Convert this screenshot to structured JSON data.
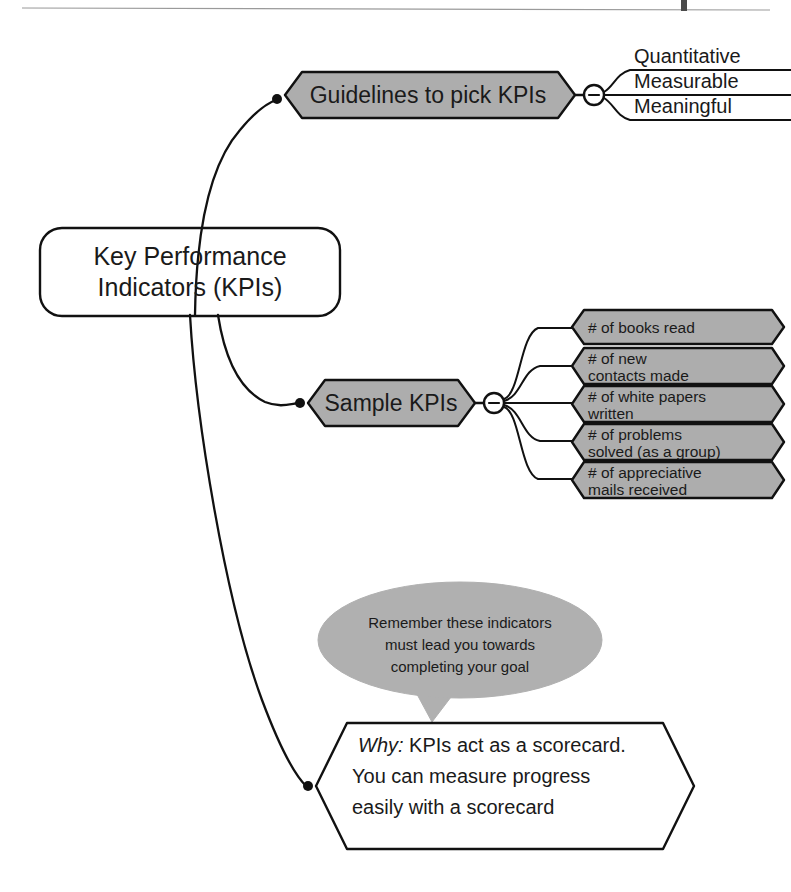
{
  "page": {
    "background_color": "#ffffff",
    "ink_color": "#111111",
    "node_fill_color": "#adadad",
    "bubble_fill_color": "#b0b0b0",
    "rule_color": "#9a9a9a"
  },
  "root": {
    "line1": "Key Performance",
    "line2": "Indicators (KPIs)"
  },
  "branches": [
    {
      "id": "guidelines",
      "label": "Guidelines to pick KPIs",
      "toggle": "collapse-minus-icon",
      "children": [
        {
          "label": "Quantitative"
        },
        {
          "label": "Measurable"
        },
        {
          "label": "Meaningful"
        }
      ]
    },
    {
      "id": "sample-kpis",
      "label": "Sample KPIs",
      "toggle": "collapse-minus-icon",
      "children": [
        {
          "line1": "# of books read",
          "line2": ""
        },
        {
          "line1": "# of new",
          "line2": "contacts made"
        },
        {
          "line1": "# of white papers",
          "line2": "written"
        },
        {
          "line1": "# of problems",
          "line2": "solved (as a group)"
        },
        {
          "line1": "# of appreciative",
          "line2": "mails received"
        }
      ]
    },
    {
      "id": "why",
      "label_prefix": "Why:",
      "line1_rest": " KPIs act as a scorecard.",
      "line2": "You can measure progress",
      "line3": "easily with a scorecard"
    }
  ],
  "callout": {
    "line1": "Remember these indicators",
    "line2": "must lead you towards",
    "line3": "completing your goal"
  }
}
